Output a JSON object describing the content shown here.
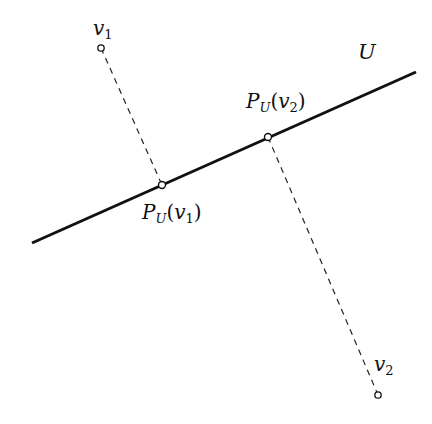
{
  "diagram": {
    "subspace_label": "U",
    "line": {
      "x1": 32,
      "y1": 243,
      "x2": 416,
      "y2": 72
    },
    "points": [
      {
        "name": "v",
        "sub": "1",
        "x": 101,
        "y": 48
      },
      {
        "name": "v",
        "sub": "2",
        "x": 378,
        "y": 395
      }
    ],
    "projections": [
      {
        "name": "P",
        "sub": "U",
        "arg": "v",
        "arg_sub": "1",
        "x": 162,
        "y": 185
      },
      {
        "name": "P",
        "sub": "U",
        "arg": "v",
        "arg_sub": "2",
        "x": 268,
        "y": 137
      }
    ]
  }
}
